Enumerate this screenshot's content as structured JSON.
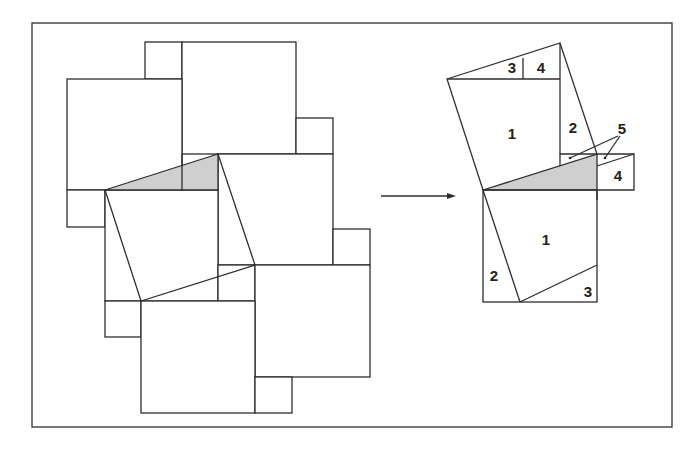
{
  "figure": {
    "colors": {
      "line": "#2e2e2e",
      "shade": "#cfcfcf",
      "background": "#ffffff"
    },
    "left_tiling": {
      "label": ""
    },
    "arrow": {
      "direction": "right"
    },
    "right_figure": {
      "labels": [
        {
          "text": "3",
          "x": 512,
          "y": 67
        },
        {
          "text": "4",
          "x": 541,
          "y": 67
        },
        {
          "text": "1",
          "x": 512,
          "y": 133
        },
        {
          "text": "2",
          "x": 573,
          "y": 127
        },
        {
          "text": "5",
          "x": 622,
          "y": 128
        },
        {
          "text": "4",
          "x": 618,
          "y": 175
        },
        {
          "text": "1",
          "x": 546,
          "y": 239
        },
        {
          "text": "2",
          "x": 494,
          "y": 275
        },
        {
          "text": "3",
          "x": 588,
          "y": 291
        }
      ]
    }
  }
}
